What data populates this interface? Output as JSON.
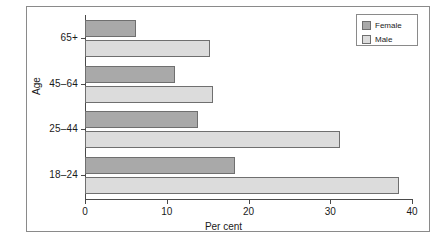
{
  "chart_data": {
    "type": "bar",
    "orientation": "horizontal",
    "title": "",
    "xlabel": "Per cent",
    "ylabel": "Age",
    "categories": [
      "18–24",
      "25–44",
      "45–64",
      "65+"
    ],
    "series": [
      {
        "name": "Female",
        "color": "#a9a9a9",
        "values": [
          18.3,
          13.8,
          11.0,
          6.2
        ]
      },
      {
        "name": "Male",
        "color": "#dcdcdc",
        "values": [
          38.4,
          31.2,
          15.6,
          15.3
        ]
      }
    ],
    "xlim": [
      0,
      40
    ],
    "xticks": [
      0,
      10,
      20,
      30,
      40
    ],
    "xtick_labels": [
      "0",
      "10",
      "20",
      "30",
      "40"
    ],
    "grid": false,
    "legend_position": "top-right",
    "legend_entries": [
      "Female",
      "Male"
    ]
  },
  "axes": {
    "x_label": "Per cent",
    "y_label": "Age"
  },
  "legend": {
    "items": [
      {
        "label": "Female",
        "swatch": "female"
      },
      {
        "label": "Male",
        "swatch": "male"
      }
    ]
  }
}
